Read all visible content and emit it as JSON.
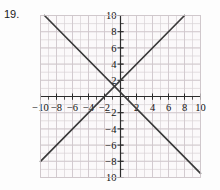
{
  "problem": {
    "number": "19."
  },
  "chart_data": {
    "type": "line",
    "title": "",
    "xlabel": "",
    "ylabel": "",
    "xlim": [
      -10,
      10
    ],
    "ylim": [
      -10,
      10
    ],
    "grid": true,
    "grid_step": 1,
    "tick_step": 2,
    "legend": "none",
    "x_tick_labels": [
      "-10",
      "-8",
      "-6",
      "-4",
      "-2",
      "2",
      "4",
      "6",
      "8",
      "10"
    ],
    "x_tick_values": [
      -10,
      -8,
      -6,
      -4,
      -2,
      2,
      4,
      6,
      8,
      10
    ],
    "y_tick_labels": [
      "10",
      "8",
      "6",
      "4",
      "2",
      "-2",
      "-4",
      "-6",
      "-8",
      "-10"
    ],
    "y_tick_values": [
      10,
      8,
      6,
      4,
      2,
      -2,
      -4,
      -6,
      -8,
      -10
    ],
    "series": [
      {
        "name": "ascending-line",
        "equation": "y = x + 2",
        "slope": 1,
        "intercept": 2,
        "points": [
          [
            -10,
            -8
          ],
          [
            8,
            10
          ]
        ],
        "color": "#3a3a3a"
      },
      {
        "name": "descending-line",
        "equation": "y = -x + 1",
        "slope": -1,
        "intercept": 1,
        "points": [
          [
            -9.5,
            10
          ],
          [
            10,
            -9.5
          ]
        ],
        "color": "#3a3a3a"
      }
    ],
    "colors": {
      "grid_minor": "#d9d3d6",
      "axis": "#2b2b2b",
      "line": "#3a3a3a",
      "background": "#fbf9fa",
      "text": "#111111"
    }
  }
}
